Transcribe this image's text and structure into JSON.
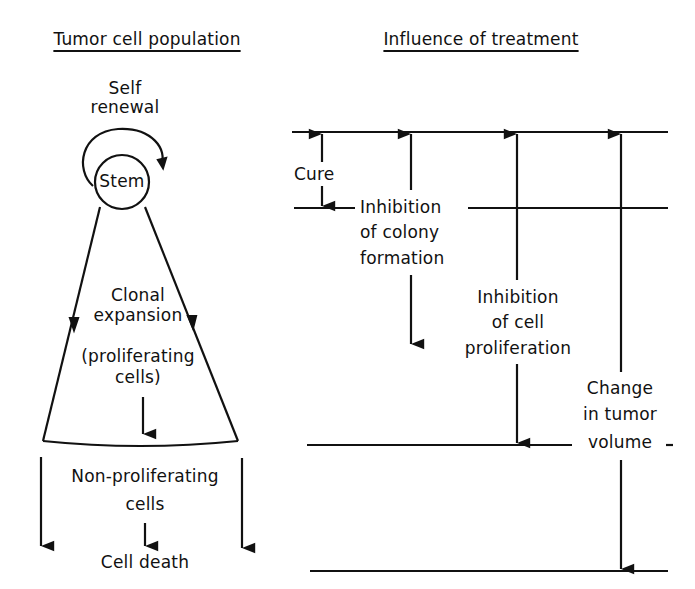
{
  "panels": {
    "left": {
      "title": "Tumor cell population",
      "self_renewal": [
        "Self",
        "renewal"
      ],
      "stem": "Stem",
      "clonal": [
        "Clonal",
        "expansion"
      ],
      "proliferating": [
        "(proliferating",
        "cells)"
      ],
      "non_proliferating": [
        "Non-proliferating",
        "cells"
      ],
      "cell_death": "Cell death"
    },
    "right": {
      "title": "Influence of treatment",
      "cure": "Cure",
      "colony": [
        "Inhibition",
        "of colony",
        "formation"
      ],
      "proliferation": [
        "Inhibition",
        "of cell",
        "proliferation"
      ],
      "volume": [
        "Change",
        "in tumor",
        "volume"
      ]
    }
  },
  "colors": {
    "ink": "#111111",
    "background": "#ffffff"
  }
}
